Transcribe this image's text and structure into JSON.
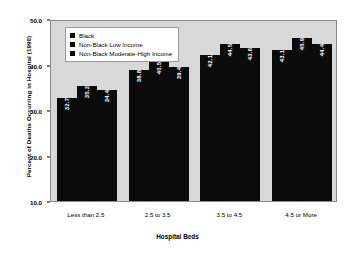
{
  "chart_data": {
    "type": "bar",
    "title": "",
    "xlabel": "Hospital Beds",
    "ylabel": "Percent of Deaths Occurring in Hospital (1990)",
    "categories": [
      "Less than 2.5",
      "2.5 to 3.5",
      "3.5 to 4.5",
      "4.5 or More"
    ],
    "series": [
      {
        "name": "Black",
        "values": [
          32.7,
          38.8,
          42.1,
          43.1
        ]
      },
      {
        "name": "Non-Black Low Income",
        "values": [
          35.2,
          40.5,
          44.5,
          45.9
        ]
      },
      {
        "name": "Non-Black Moderate-High Income",
        "values": [
          34.4,
          39.4,
          43.6,
          44.4
        ]
      }
    ],
    "ylim": [
      10.0,
      50.0
    ],
    "yticks": [
      "50.0",
      "40.0",
      "30.0",
      "20.0",
      "10.0"
    ],
    "ytick_values": [
      50.0,
      40.0,
      30.0,
      20.0,
      10.0
    ],
    "grid": false,
    "legend_position": "top-left-inside",
    "bar_color": "#0b0b0b",
    "plot_background": "#d8d8d8",
    "figure_background": "#ffffff",
    "value_label_color": "#ffffff"
  }
}
